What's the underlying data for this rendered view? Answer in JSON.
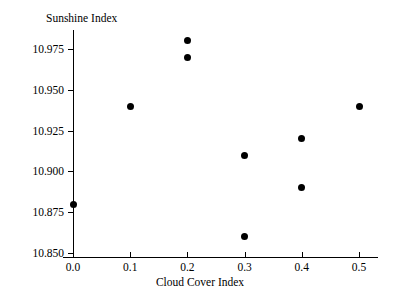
{
  "chart_data": {
    "type": "scatter",
    "title": "",
    "xlabel": "Cloud Cover Index",
    "ylabel": "Sunshine Index",
    "xlim": [
      -0.03,
      0.535
    ],
    "ylim": [
      10.8445,
      10.9835
    ],
    "xticks": [
      "0.0",
      "0.1",
      "0.2",
      "0.3",
      "0.4",
      "0.5"
    ],
    "xtick_values": [
      0.0,
      0.1,
      0.2,
      0.3,
      0.4,
      0.5
    ],
    "yticks": [
      "10.850",
      "10.875",
      "10.900",
      "10.925",
      "10.950",
      "10.975"
    ],
    "ytick_values": [
      10.85,
      10.875,
      10.9,
      10.925,
      10.95,
      10.975
    ],
    "grid": false,
    "legend": false,
    "marker": "filled-circle",
    "marker_color": "#000000",
    "axis_color": "#000000",
    "background_color": "#ffffff",
    "x": [
      0.0,
      0.1,
      0.2,
      0.2,
      0.3,
      0.3,
      0.4,
      0.4,
      0.5
    ],
    "y": [
      10.88,
      10.94,
      10.98,
      10.97,
      10.91,
      10.86,
      10.92,
      10.89,
      10.94
    ],
    "points": [
      {
        "x": 0.0,
        "y": 10.88
      },
      {
        "x": 0.1,
        "y": 10.94
      },
      {
        "x": 0.2,
        "y": 10.98
      },
      {
        "x": 0.2,
        "y": 10.97
      },
      {
        "x": 0.3,
        "y": 10.91
      },
      {
        "x": 0.3,
        "y": 10.86
      },
      {
        "x": 0.4,
        "y": 10.92
      },
      {
        "x": 0.4,
        "y": 10.89
      },
      {
        "x": 0.5,
        "y": 10.94
      }
    ]
  }
}
